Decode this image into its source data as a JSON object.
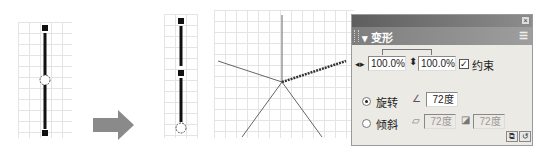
{
  "figure": {
    "before": {
      "description": "single line segment with center transform point"
    },
    "arrow": {
      "icon": "right-arrow-icon",
      "color": "#8a8a8a"
    },
    "after": {
      "description": "line segment with transform point moved to bottom endpoint"
    },
    "result": {
      "description": "five line copies rotated 72 degrees around a point"
    }
  },
  "panel": {
    "close_icon": "close-icon",
    "title": "▾ 变形",
    "menu_icon": "options-menu-icon",
    "width_icon": "horizontal-scale-icon",
    "width_value": "100.0%",
    "height_icon": "vertical-scale-icon",
    "height_value": "100.0%",
    "constrain_checked": true,
    "constrain_label": "约束",
    "rotate": {
      "selected": true,
      "label": "旋转",
      "icon": "rotate-angle-icon",
      "value": "72度"
    },
    "skew": {
      "selected": false,
      "label": "倾斜",
      "h_icon": "skew-horizontal-icon",
      "h_value": "72度",
      "v_icon": "skew-vertical-icon",
      "v_value": "72度"
    },
    "buttons": {
      "copy_and_apply": "copy-and-apply-transform-icon",
      "reset": "reset-transform-icon"
    }
  }
}
